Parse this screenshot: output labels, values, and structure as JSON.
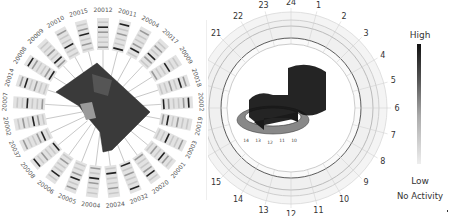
{
  "left_diagram": {
    "title": "",
    "zip_codes": [
      "20011",
      "20004",
      "20017",
      "20009",
      "20018",
      "20002",
      "20019",
      "20003",
      "20001",
      "20020",
      "20032",
      "20024",
      "20004",
      "20005",
      "20006",
      "20008",
      "20037",
      "20002",
      "20007",
      "20014",
      "20008",
      "20009",
      "20010",
      "20015",
      "20012"
    ],
    "map_shape": "Washington DC"
  },
  "right_diagram": {
    "hour_labels": [
      "24",
      "1",
      "2",
      "3",
      "4",
      "5",
      "6",
      "7",
      "8",
      "9",
      "10",
      "11",
      "12",
      "13",
      "14",
      "15",
      "16",
      "17",
      "18",
      "19",
      "20",
      "21",
      "22",
      "23"
    ],
    "inner_labels": [
      "14",
      "13",
      "12",
      "11",
      "10"
    ]
  },
  "legend": {
    "high_label": "High",
    "low_label": "Low",
    "no_activity_label": "No Activity",
    "colors": {
      "high": "#111111",
      "low": "#eeeeee"
    }
  }
}
